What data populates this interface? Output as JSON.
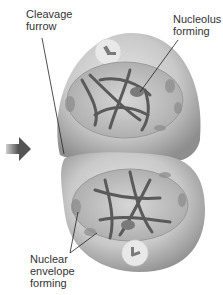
{
  "diagram": {
    "type": "cell-division-cytokinesis",
    "labels": {
      "cleavage_furrow": [
        "Cleavage",
        "furrow"
      ],
      "nucleolus_forming": [
        "Nucleolus",
        "forming"
      ],
      "nuclear_envelope_forming": [
        "Nuclear",
        "envelope",
        "forming"
      ]
    },
    "colors": {
      "cell_fill": "#c8c8c8",
      "cell_shadow": "#9a9a9a",
      "nucleus_fill": "#bdbdbd",
      "chromosome": "#5a5a5a",
      "arrow": "#555555",
      "leader_line": "#222222"
    }
  }
}
